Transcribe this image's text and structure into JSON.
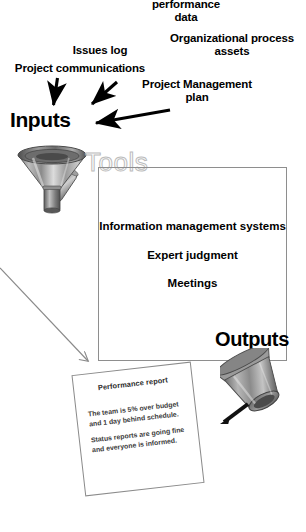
{
  "diagram": {
    "background_color": "#ffffff",
    "text_color": "#000000",
    "box_border_color": "#8e8e8e",
    "arrow_color": "#000000",
    "thin_arrow_color": "#8a8a8a"
  },
  "inputs": {
    "heading": "Inputs",
    "labels": [
      {
        "id": "work-performance-data",
        "text": "performance\ndata"
      },
      {
        "id": "issues-log",
        "text": "Issues log"
      },
      {
        "id": "organizational-process-assets",
        "text": "Organizational process\nassets"
      },
      {
        "id": "project-communications",
        "text": "Project communications"
      },
      {
        "id": "project-management-plan",
        "text": "Project Management\nplan"
      }
    ],
    "icon": "funnel-icon"
  },
  "tools": {
    "heading": "Tools",
    "items": [
      {
        "text": "Information\nmanagement systems"
      },
      {
        "text": "Expert judgment"
      },
      {
        "text": "Meetings"
      }
    ]
  },
  "outputs": {
    "heading": "Outputs",
    "icon": "inverted-funnel-icon",
    "report": {
      "title": "Performance report",
      "paragraphs": [
        "The team is 5% over budget\nand 1 day behind schedule.",
        "Status reports are going fine\nand everyone is informed."
      ]
    }
  }
}
